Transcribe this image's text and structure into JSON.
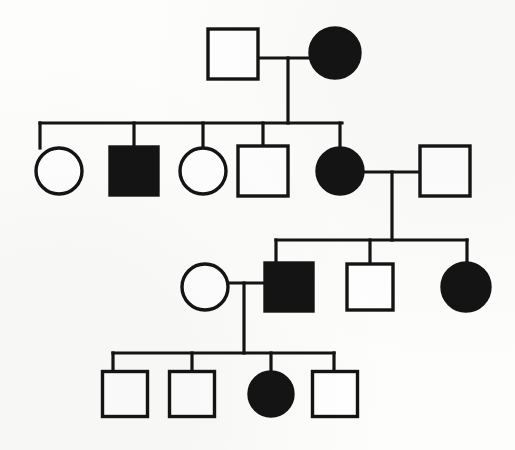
{
  "figure": {
    "width": 515,
    "height": 450,
    "background_color": "#fdfdfb",
    "line_color": "#141414",
    "affected_fill_color": "#141414",
    "unaffected_fill_color": "#ffffff"
  },
  "legend_semantics": {
    "square": "male",
    "circle": "female",
    "filled": "affected",
    "open": "unaffected"
  },
  "generations": [
    {
      "label": "I",
      "individuals": [
        {
          "id": "I-1",
          "shape": "square",
          "status": "unaffected",
          "x": 233,
          "y": 54,
          "size": 50
        },
        {
          "id": "I-2",
          "shape": "circle",
          "status": "affected",
          "x": 335,
          "y": 53,
          "size": 50
        }
      ]
    },
    {
      "label": "II",
      "individuals": [
        {
          "id": "II-1",
          "shape": "circle",
          "status": "unaffected",
          "x": 59,
          "y": 171,
          "size": 46
        },
        {
          "id": "II-2",
          "shape": "square",
          "status": "affected",
          "x": 134,
          "y": 171,
          "size": 48
        },
        {
          "id": "II-3",
          "shape": "circle",
          "status": "unaffected",
          "x": 203,
          "y": 171,
          "size": 46
        },
        {
          "id": "II-4",
          "shape": "square",
          "status": "unaffected",
          "x": 263,
          "y": 171,
          "size": 50
        },
        {
          "id": "II-5",
          "shape": "circle",
          "status": "affected",
          "x": 340,
          "y": 171,
          "size": 46
        },
        {
          "id": "II-6",
          "shape": "square",
          "status": "unaffected",
          "x": 445,
          "y": 171,
          "size": 50
        }
      ]
    },
    {
      "label": "III",
      "individuals": [
        {
          "id": "III-1",
          "shape": "circle",
          "status": "unaffected",
          "x": 205,
          "y": 287,
          "size": 46
        },
        {
          "id": "III-2",
          "shape": "square",
          "status": "affected",
          "x": 289,
          "y": 287,
          "size": 48
        },
        {
          "id": "III-3",
          "shape": "square",
          "status": "unaffected",
          "x": 370,
          "y": 287,
          "size": 46
        },
        {
          "id": "III-4",
          "shape": "circle",
          "status": "affected",
          "x": 466,
          "y": 287,
          "size": 48
        }
      ]
    },
    {
      "label": "IV",
      "individuals": [
        {
          "id": "IV-1",
          "shape": "square",
          "status": "unaffected",
          "x": 125,
          "y": 394,
          "size": 45
        },
        {
          "id": "IV-2",
          "shape": "square",
          "status": "unaffected",
          "x": 192,
          "y": 394,
          "size": 45
        },
        {
          "id": "IV-3",
          "shape": "circle",
          "status": "affected",
          "x": 271,
          "y": 394,
          "size": 44
        },
        {
          "id": "IV-4",
          "shape": "square",
          "status": "unaffected",
          "x": 335,
          "y": 394,
          "size": 45
        }
      ]
    }
  ],
  "connections": {
    "mating_lines": [
      {
        "id": "mating-I-1-x-I-2",
        "y": 58,
        "x_start": 258,
        "x_end": 312
      },
      {
        "id": "mating-II-5-x-II-6",
        "y": 172,
        "x_start": 364,
        "x_end": 420
      },
      {
        "id": "mating-III-1-x-III-2",
        "y": 283,
        "x_start": 228,
        "x_end": 266
      }
    ],
    "descent_lines": [
      {
        "id": "descent-gen-I",
        "x": 288,
        "y_start": 58,
        "y_end": 123
      },
      {
        "id": "descent-gen-II",
        "x": 392,
        "y_start": 172,
        "y_end": 240
      },
      {
        "id": "descent-gen-III",
        "x": 244,
        "y_start": 283,
        "y_end": 353
      }
    ],
    "sibship_lines": [
      {
        "id": "sibship-gen-II",
        "y": 123,
        "x_start": 40,
        "x_end": 342,
        "drops": [
          40,
          134,
          203,
          263,
          340
        ]
      },
      {
        "id": "sibship-gen-III",
        "y": 240,
        "x_start": 276,
        "x_end": 467,
        "drops": [
          276,
          370,
          467
        ]
      },
      {
        "id": "sibship-gen-IV",
        "y": 353,
        "x_start": 113,
        "x_end": 334,
        "drops": [
          113,
          192,
          271,
          334
        ]
      }
    ]
  }
}
